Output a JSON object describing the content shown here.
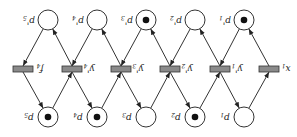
{
  "diagram": {
    "type": "petri-net",
    "orientation": "rotated-180",
    "top_places": [
      {
        "label": "p'5",
        "x": 48,
        "token": false
      },
      {
        "label": "p'4",
        "x": 97,
        "token": false
      },
      {
        "label": "p'3",
        "x": 146,
        "token": true
      },
      {
        "label": "p'2",
        "x": 195,
        "token": false
      },
      {
        "label": "p'1",
        "x": 244,
        "token": true
      }
    ],
    "bottom_places": [
      {
        "label": "p5",
        "x": 48,
        "token": true
      },
      {
        "label": "p4",
        "x": 97,
        "token": true
      },
      {
        "label": "p3",
        "x": 146,
        "token": false
      },
      {
        "label": "p2",
        "x": 195,
        "token": true
      },
      {
        "label": "p1",
        "x": 244,
        "token": false
      }
    ],
    "transitions": [
      {
        "label": "f4",
        "x": 23
      },
      {
        "label": "y'4",
        "x": 72
      },
      {
        "label": "y'3",
        "x": 121
      },
      {
        "label": "y'2",
        "x": 170
      },
      {
        "label": "y'1",
        "x": 220
      },
      {
        "label": "x1",
        "x": 269
      }
    ],
    "colors": {
      "stroke": "#333333",
      "transition_fill": "#8a8a8a",
      "token": "#111111"
    }
  }
}
